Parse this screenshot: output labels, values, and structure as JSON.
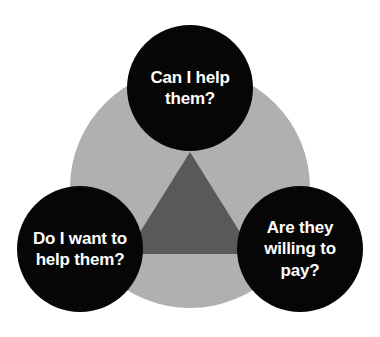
{
  "diagram": {
    "type": "venn-three-circle",
    "colors": {
      "background": "#ffffff",
      "outer_circle": "#b0b0b0",
      "inner_overlap": "#595959",
      "node_fill": "#060606",
      "node_text": "#ffffff"
    },
    "nodes": [
      {
        "id": "can-i-help-them",
        "label": "Can I help\nthem?",
        "position": "top",
        "cx": 190,
        "cy": 88,
        "r": 63
      },
      {
        "id": "do-i-want-to-help-them",
        "label": "Do I want to\nhelp them?",
        "position": "bottom-left",
        "cx": 80,
        "cy": 249,
        "r": 63
      },
      {
        "id": "are-they-willing-to-pay",
        "label": "Are they\nwilling to\npay?",
        "position": "bottom-right",
        "cx": 300,
        "cy": 249,
        "r": 63
      }
    ],
    "outer_circle": {
      "cx": 190,
      "cy": 188,
      "r": 120
    }
  }
}
